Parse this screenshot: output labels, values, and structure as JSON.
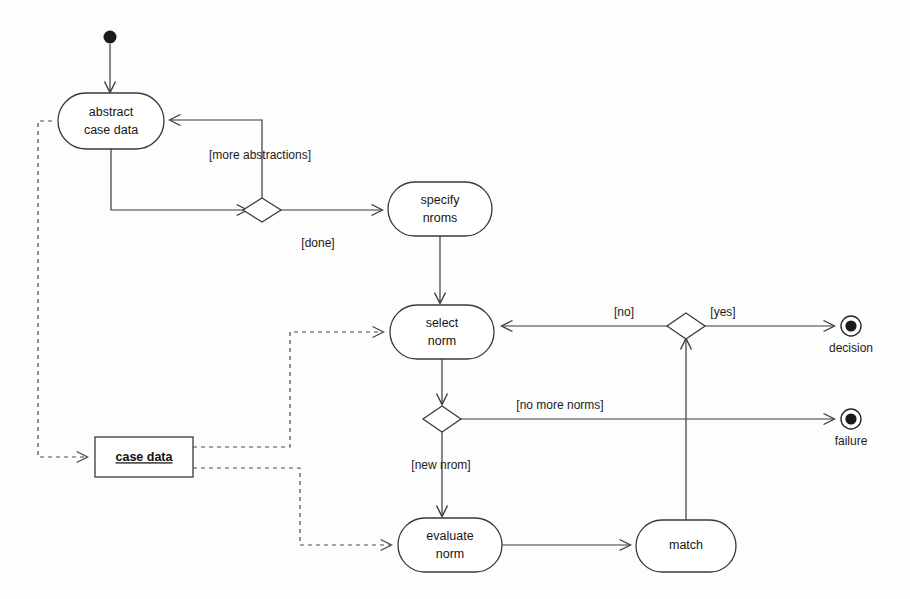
{
  "diagram": {
    "type": "uml-activity-diagram",
    "colors": {
      "stroke": "#3a3a3a",
      "fill": "#ffffff",
      "text": "#161616",
      "background": "#fdfdfd"
    },
    "activities": [
      {
        "id": "abstract-case-data",
        "label_line1": "abstract",
        "label_line2": "case data"
      },
      {
        "id": "specify-nroms",
        "label_line1": "specify",
        "label_line2": "nroms"
      },
      {
        "id": "select-norm",
        "label_line1": "select",
        "label_line2": "norm"
      },
      {
        "id": "evaluate-norm",
        "label_line1": "evaluate",
        "label_line2": "norm"
      },
      {
        "id": "match",
        "label_line1": "match",
        "label_line2": ""
      }
    ],
    "object_nodes": [
      {
        "id": "case-data-object",
        "label": "case data"
      }
    ],
    "end_states": [
      {
        "id": "decision-end",
        "label": "decision"
      },
      {
        "id": "failure-end",
        "label": "failure"
      }
    ],
    "guards": [
      {
        "id": "guard-more-abstractions",
        "label": "[more abstractions]"
      },
      {
        "id": "guard-done",
        "label": "[done]"
      },
      {
        "id": "guard-no",
        "label": "[no]"
      },
      {
        "id": "guard-yes",
        "label": "[yes]"
      },
      {
        "id": "guard-no-more-norms",
        "label": "[no more norms]"
      },
      {
        "id": "guard-new-nrom",
        "label": "[new nrom]"
      }
    ],
    "start_node": {
      "id": "initial-node",
      "label": ""
    }
  }
}
